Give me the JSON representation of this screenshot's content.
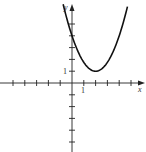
{
  "chart_data": {
    "type": "line",
    "title": "",
    "xlabel": "x",
    "ylabel": "y",
    "xlim": [
      -5,
      5
    ],
    "ylim": [
      -6,
      6
    ],
    "grid": false,
    "x_tick_labels": [
      "1"
    ],
    "y_tick_labels": [
      "1"
    ],
    "x_ticks": [
      -5,
      -4,
      -3,
      -2,
      -1,
      1,
      2,
      3,
      4,
      5
    ],
    "y_ticks": [
      -5,
      -4,
      -3,
      -2,
      -1,
      1,
      2,
      3,
      4,
      5
    ],
    "series": [
      {
        "name": "parabola",
        "description": "upward-opening parabola with vertex at (2, 1) and y-intercept about 4",
        "equation_estimate": "y = 0.75(x - 2)^2 + 1",
        "vertex": [
          2,
          1
        ],
        "x": [
          -0.75,
          -0.5,
          0,
          0.5,
          1,
          1.5,
          2,
          2.5,
          3,
          3.5,
          4,
          4.5,
          4.7
        ],
        "y": [
          6.67,
          5.69,
          4.0,
          2.69,
          1.75,
          1.19,
          1.0,
          1.19,
          1.75,
          2.69,
          4.0,
          5.69,
          6.47
        ]
      }
    ],
    "legend": null
  },
  "labels": {
    "x_axis": "x",
    "y_axis": "y",
    "x_one": "1",
    "y_one": "1"
  },
  "style": {
    "axis_color": "#222222",
    "curve_color": "#111111"
  }
}
